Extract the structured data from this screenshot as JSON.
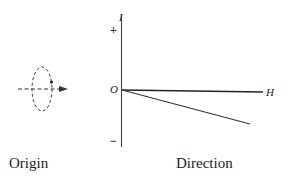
{
  "diagram": {
    "left_panel": {
      "caption": "Origin",
      "figure": "dashed-ellipse-loop-with-arrow-axis"
    },
    "right_panel": {
      "caption": "Direction",
      "axes": {
        "vertical_label": "I",
        "horizontal_label": "H",
        "origin_label": "O",
        "positive_sign": "+",
        "negative_sign": "−"
      },
      "lines": [
        {
          "name": "horizontal-axis-H",
          "from": [
            122,
            90
          ],
          "to": [
            263,
            92
          ]
        },
        {
          "name": "descending-line",
          "from": [
            122,
            90
          ],
          "to": [
            250,
            124
          ]
        }
      ]
    },
    "colors": {
      "ink": "#222222",
      "background": "#ffffff"
    }
  }
}
